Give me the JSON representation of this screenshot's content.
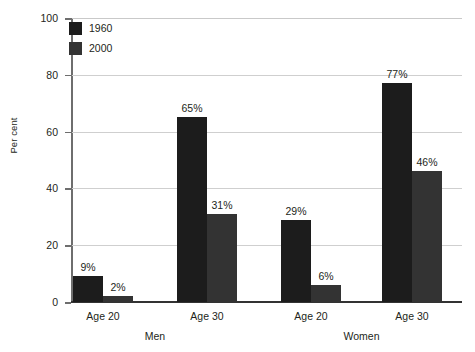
{
  "chart_data": {
    "type": "bar",
    "title": "",
    "subtitle": "",
    "xlabel": "",
    "ylabel": "Per cent",
    "ylim": [
      0,
      100
    ],
    "yticks": [
      0,
      20,
      40,
      60,
      80,
      100
    ],
    "ytick_labels": [
      "0",
      "20",
      "40",
      "60",
      "80",
      "100"
    ],
    "grid": true,
    "legend_position": "top-left-inside",
    "categories": [
      "Age 20",
      "Age 30",
      "Age 20",
      "Age 30"
    ],
    "groups": [
      {
        "label": "Men",
        "categories": [
          "Age 20",
          "Age 30"
        ]
      },
      {
        "label": "Women",
        "categories": [
          "Age 20",
          "Age 30"
        ]
      }
    ],
    "series": [
      {
        "name": "1960",
        "color": "#1c1c1c",
        "values": [
          9,
          65,
          29,
          77
        ],
        "value_labels": [
          "9%",
          "65%",
          "29%",
          "77%"
        ]
      },
      {
        "name": "2000",
        "color": "#333333",
        "values": [
          2,
          31,
          6,
          46
        ],
        "value_labels": [
          "2%",
          "31%",
          "6%",
          "46%"
        ]
      }
    ]
  },
  "legend": {
    "items": [
      {
        "label": "1960",
        "color": "#1c1c1c"
      },
      {
        "label": "2000",
        "color": "#333333"
      }
    ]
  }
}
